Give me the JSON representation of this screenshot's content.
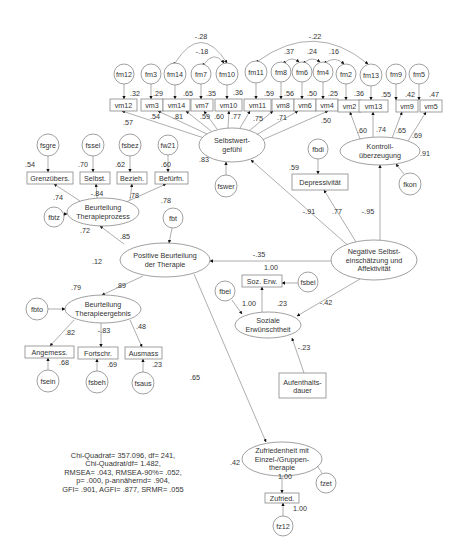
{
  "diagram": {
    "type": "structural-equation-model",
    "fit_stats": [
      "Chi-Quadrat= 357.096, df= 241,",
      "Chi-Quadrat/df= 1.482,",
      "RMSEA= .043, RMSEA-90%= .052,",
      "p= .000, p-annähernd= .904,",
      "GFI= .901, AGFI= .877, SRMR= .055"
    ],
    "latent": [
      {
        "id": "selbstwert",
        "lines": [
          "Selbstwert-",
          "gefühl"
        ],
        "cx": 232,
        "cy": 145,
        "rx": 33,
        "ry": 17
      },
      {
        "id": "kontroll",
        "lines": [
          "Kontroll-",
          "überzeugung"
        ],
        "cx": 380,
        "cy": 151,
        "rx": 40,
        "ry": 14
      },
      {
        "id": "bt_prozess",
        "lines": [
          "Beurteilung",
          "Therapieprozess"
        ],
        "cx": 103,
        "cy": 212,
        "rx": 36,
        "ry": 14
      },
      {
        "id": "pos_beurt",
        "lines": [
          "Positive Beurteilung",
          "der Therapie"
        ],
        "cx": 165,
        "cy": 260,
        "rx": 45,
        "ry": 17
      },
      {
        "id": "neg",
        "lines": [
          "Negative Selbst-",
          "einschätzung und",
          "Affektivität"
        ],
        "cx": 374,
        "cy": 260,
        "rx": 43,
        "ry": 20
      },
      {
        "id": "bt_ergebnis",
        "lines": [
          "Beurteilung",
          "Therapieergebnis"
        ],
        "cx": 103,
        "cy": 309,
        "rx": 38,
        "ry": 14
      },
      {
        "id": "soz_erw",
        "lines": [
          "Soziale",
          "Erwünschtheit"
        ],
        "cx": 268,
        "cy": 325,
        "rx": 33,
        "ry": 13
      },
      {
        "id": "zufrieden",
        "lines": [
          "Zufriedenheit mit",
          "Einzel-/Gruppen-",
          "therapie"
        ],
        "cx": 282,
        "cy": 459,
        "rx": 40,
        "ry": 17
      }
    ],
    "observed": [
      {
        "id": "vm12",
        "label": "vm12",
        "x": 110,
        "y": 99,
        "w": 27,
        "h": 12
      },
      {
        "id": "vm3",
        "label": "vm3",
        "x": 141,
        "y": 99,
        "w": 22,
        "h": 12
      },
      {
        "id": "vm14",
        "label": "vm14",
        "x": 163,
        "y": 99,
        "w": 27,
        "h": 12
      },
      {
        "id": "vm7",
        "label": "vm7",
        "x": 191,
        "y": 99,
        "w": 22,
        "h": 12
      },
      {
        "id": "vm10",
        "label": "vm10",
        "x": 215,
        "y": 99,
        "w": 27,
        "h": 12
      },
      {
        "id": "vm11",
        "label": "vm11",
        "x": 244,
        "y": 99,
        "w": 27,
        "h": 12
      },
      {
        "id": "vm8",
        "label": "vm8",
        "x": 272,
        "y": 99,
        "w": 22,
        "h": 12
      },
      {
        "id": "vm6",
        "label": "vm6",
        "x": 294,
        "y": 99,
        "w": 22,
        "h": 12
      },
      {
        "id": "vm4",
        "label": "vm4",
        "x": 316,
        "y": 99,
        "w": 22,
        "h": 12
      },
      {
        "id": "vm2",
        "label": "vm2",
        "x": 338,
        "y": 100,
        "w": 23,
        "h": 12
      },
      {
        "id": "vm13",
        "label": "vm13",
        "x": 359,
        "y": 100,
        "w": 29,
        "h": 12
      },
      {
        "id": "vm9",
        "label": "vm9",
        "x": 396,
        "y": 100,
        "w": 22,
        "h": 12
      },
      {
        "id": "vm5",
        "label": "vm5",
        "x": 420,
        "y": 100,
        "w": 22,
        "h": 12
      },
      {
        "id": "grenz",
        "label": "Grenzübers.",
        "x": 27,
        "y": 172,
        "w": 46,
        "h": 12
      },
      {
        "id": "selbst",
        "label": "Selbst.",
        "x": 80,
        "y": 172,
        "w": 30,
        "h": 12
      },
      {
        "id": "bezieh",
        "label": "Bezieh.",
        "x": 117,
        "y": 172,
        "w": 30,
        "h": 12
      },
      {
        "id": "befurfn",
        "label": "Befürfn.",
        "x": 155,
        "y": 172,
        "w": 33,
        "h": 12
      },
      {
        "id": "depress",
        "label": "Depressivität",
        "x": 292,
        "y": 174,
        "w": 56,
        "h": 16
      },
      {
        "id": "sozerw_box",
        "label": "Soz. Erw.",
        "x": 242,
        "y": 275,
        "w": 40,
        "h": 12
      },
      {
        "id": "angemess",
        "label": "Angemess.",
        "x": 25,
        "y": 346,
        "w": 49,
        "h": 12
      },
      {
        "id": "fortschr",
        "label": "Fortschr.",
        "x": 78,
        "y": 347,
        "w": 40,
        "h": 12
      },
      {
        "id": "ausmass",
        "label": "Ausmass",
        "x": 125,
        "y": 347,
        "w": 37,
        "h": 12
      },
      {
        "id": "aufent",
        "label": "Aufenthalts-",
        "label2": "dauer",
        "x": 279,
        "y": 373,
        "w": 47,
        "h": 25
      },
      {
        "id": "zufried_box",
        "label": "Zufried.",
        "x": 265,
        "y": 493,
        "w": 34,
        "h": 10
      }
    ],
    "errors": [
      {
        "id": "fm12",
        "label": "fm12",
        "cx": 124,
        "cy": 74,
        "r": 10
      },
      {
        "id": "fm3",
        "label": "fm3",
        "cx": 151,
        "cy": 74,
        "r": 10
      },
      {
        "id": "fm14",
        "label": "fm14",
        "cx": 175,
        "cy": 74,
        "r": 11
      },
      {
        "id": "fm7",
        "label": "fm7",
        "cx": 201,
        "cy": 74,
        "r": 10
      },
      {
        "id": "fm10",
        "label": "fm10",
        "cx": 227,
        "cy": 74,
        "r": 11
      },
      {
        "id": "fm11",
        "label": "fm11",
        "cx": 256,
        "cy": 72,
        "r": 11
      },
      {
        "id": "fm8",
        "label": "fm8",
        "cx": 281,
        "cy": 72,
        "r": 10
      },
      {
        "id": "fm6",
        "label": "fm6",
        "cx": 302,
        "cy": 72,
        "r": 10
      },
      {
        "id": "fm4",
        "label": "fm4",
        "cx": 323,
        "cy": 72,
        "r": 10
      },
      {
        "id": "fm2",
        "label": "fm2",
        "cx": 346,
        "cy": 74,
        "r": 10
      },
      {
        "id": "fm13",
        "label": "fm13",
        "cx": 371,
        "cy": 75,
        "r": 11
      },
      {
        "id": "fm9",
        "label": "fm9",
        "cx": 396,
        "cy": 74,
        "r": 10
      },
      {
        "id": "fm5",
        "label": "fm5",
        "cx": 419,
        "cy": 74,
        "r": 10
      },
      {
        "id": "fsgre",
        "label": "fsgre",
        "cx": 48,
        "cy": 145,
        "r": 11
      },
      {
        "id": "fssel",
        "label": "fssel",
        "cx": 93,
        "cy": 145,
        "r": 11
      },
      {
        "id": "fsbez",
        "label": "fsbez",
        "cx": 130,
        "cy": 145,
        "r": 11
      },
      {
        "id": "fw21",
        "label": "fw21",
        "cx": 168,
        "cy": 145,
        "r": 10
      },
      {
        "id": "fswer",
        "label": "fswer",
        "cx": 226,
        "cy": 186,
        "r": 11
      },
      {
        "id": "fbdi",
        "label": "fbdi",
        "cx": 318,
        "cy": 149,
        "r": 10
      },
      {
        "id": "fkon",
        "label": "fkon",
        "cx": 410,
        "cy": 184,
        "r": 11
      },
      {
        "id": "fbtz",
        "label": "fbtz",
        "cx": 54,
        "cy": 217,
        "r": 10
      },
      {
        "id": "fbt",
        "label": "fbt",
        "cx": 173,
        "cy": 218,
        "r": 10
      },
      {
        "id": "fbto",
        "label": "fbto",
        "cx": 37,
        "cy": 309,
        "r": 11
      },
      {
        "id": "fbei_soz",
        "label": "fbei",
        "cx": 225,
        "cy": 291,
        "r": 10
      },
      {
        "id": "fsbei",
        "label": "fsbei",
        "cx": 308,
        "cy": 282,
        "r": 10
      },
      {
        "id": "fsein",
        "label": "fsein",
        "cx": 48,
        "cy": 381,
        "r": 11
      },
      {
        "id": "fsbeh",
        "label": "fsbeh",
        "cx": 97,
        "cy": 382,
        "r": 11
      },
      {
        "id": "fsaus",
        "label": "fsaus",
        "cx": 143,
        "cy": 383,
        "r": 11
      },
      {
        "id": "fzet",
        "label": "fzet",
        "cx": 326,
        "cy": 483,
        "r": 10
      },
      {
        "id": "fz12",
        "label": "fz12",
        "cx": 283,
        "cy": 526,
        "r": 10
      }
    ],
    "coefficients": [
      {
        "text": ".57",
        "x": 128,
        "y": 125
      },
      {
        "text": ".54",
        "x": 155,
        "y": 119
      },
      {
        "text": ".81",
        "x": 178,
        "y": 119
      },
      {
        "text": ".59",
        "x": 205,
        "y": 119
      },
      {
        "text": ".60",
        "x": 219,
        "y": 119
      },
      {
        "text": ".77",
        "x": 236,
        "y": 119
      },
      {
        "text": ".75",
        "x": 258,
        "y": 121
      },
      {
        "text": ".71",
        "x": 282,
        "y": 120
      },
      {
        "text": ".50",
        "x": 326,
        "y": 123
      },
      {
        "text": ".32",
        "x": 135,
        "y": 96
      },
      {
        "text": ".29",
        "x": 158,
        "y": 96
      },
      {
        "text": ".65",
        "x": 188,
        "y": 96
      },
      {
        "text": ".35",
        "x": 211,
        "y": 96
      },
      {
        "text": ".36",
        "x": 238,
        "y": 95
      },
      {
        "text": ".59",
        "x": 269,
        "y": 96
      },
      {
        "text": ".56",
        "x": 289,
        "y": 96
      },
      {
        "text": ".50",
        "x": 312,
        "y": 96
      },
      {
        "text": ".25",
        "x": 333,
        "y": 96
      },
      {
        "text": ".36",
        "x": 359,
        "y": 96
      },
      {
        "text": ".55",
        "x": 386,
        "y": 97
      },
      {
        "text": ".42",
        "x": 410,
        "y": 97
      },
      {
        "text": ".47",
        "x": 434,
        "y": 97
      },
      {
        "text": ".60",
        "x": 362,
        "y": 133
      },
      {
        "text": ".74",
        "x": 381,
        "y": 132
      },
      {
        "text": ".65",
        "x": 401,
        "y": 133
      },
      {
        "text": ".69",
        "x": 417,
        "y": 138
      },
      {
        "text": ".91",
        "x": 425,
        "y": 156
      },
      {
        "text": "-.28",
        "x": 201,
        "y": 39
      },
      {
        "text": "-.18",
        "x": 202,
        "y": 54
      },
      {
        "text": "-.22",
        "x": 315,
        "y": 39
      },
      {
        "text": ".37",
        "x": 289,
        "y": 54
      },
      {
        "text": ".24",
        "x": 312,
        "y": 54
      },
      {
        "text": ".16",
        "x": 334,
        "y": 54
      },
      {
        "text": ".83",
        "x": 204,
        "y": 162
      },
      {
        "text": ".54",
        "x": 30,
        "y": 167
      },
      {
        "text": ".70",
        "x": 83,
        "y": 167
      },
      {
        "text": ".62",
        "x": 120,
        "y": 167
      },
      {
        "text": ".60",
        "x": 166,
        "y": 167
      },
      {
        "text": ".74",
        "x": 58,
        "y": 200
      },
      {
        "text": "-.84",
        "x": 97,
        "y": 196
      },
      {
        "text": ".78",
        "x": 134,
        "y": 198
      },
      {
        "text": ".78",
        "x": 166,
        "y": 203
      },
      {
        "text": ".72",
        "x": 85,
        "y": 233
      },
      {
        "text": ".85",
        "x": 125,
        "y": 239
      },
      {
        "text": ".12",
        "x": 97,
        "y": 264
      },
      {
        "text": ".59",
        "x": 294,
        "y": 170
      },
      {
        "text": "-.91",
        "x": 309,
        "y": 214
      },
      {
        "text": ".77",
        "x": 337,
        "y": 214
      },
      {
        "text": "-.95",
        "x": 368,
        "y": 214
      },
      {
        "text": "-.35",
        "x": 259,
        "y": 257
      },
      {
        "text": "1.00",
        "x": 271,
        "y": 270
      },
      {
        "text": "1.00",
        "x": 249,
        "y": 306
      },
      {
        "text": ".23",
        "x": 282,
        "y": 306
      },
      {
        "text": "-.42",
        "x": 326,
        "y": 305
      },
      {
        "text": "-.23",
        "x": 304,
        "y": 350
      },
      {
        "text": ".79",
        "x": 76,
        "y": 290
      },
      {
        "text": ".89",
        "x": 121,
        "y": 288
      },
      {
        "text": ".82",
        "x": 70,
        "y": 335
      },
      {
        "text": "-.83",
        "x": 104,
        "y": 333
      },
      {
        "text": ".48",
        "x": 141,
        "y": 329
      },
      {
        "text": ".68",
        "x": 64,
        "y": 365
      },
      {
        "text": ".69",
        "x": 112,
        "y": 367
      },
      {
        "text": ".23",
        "x": 157,
        "y": 367
      },
      {
        "text": ".65",
        "x": 195,
        "y": 380
      },
      {
        "text": ".42",
        "x": 235,
        "y": 465
      },
      {
        "text": "1.00",
        "x": 285,
        "y": 479
      },
      {
        "text": "1.00",
        "x": 300,
        "y": 511
      }
    ]
  }
}
